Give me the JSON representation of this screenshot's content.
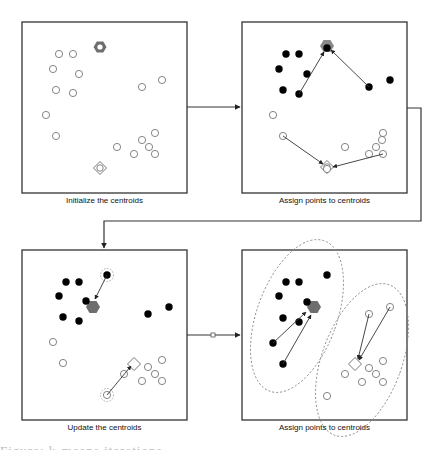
{
  "diagram": {
    "colors": {
      "border": "#333333",
      "cluster_a_point": "#000000",
      "cluster_b_point": "#ffffff",
      "open_point_stroke": "#777777",
      "centroid_a": "#6e6e6e",
      "centroid_b_stroke": "#777777",
      "arrow": "#333333",
      "ellipse": "#888888"
    },
    "panels": [
      {
        "id": "init",
        "caption": "Initialize the centroids",
        "box": [
          22,
          22,
          165,
          171
        ],
        "points_open": [
          [
            59,
            54
          ],
          [
            73,
            54
          ],
          [
            53,
            69
          ],
          [
            79,
            74
          ],
          [
            56,
            90
          ],
          [
            73,
            93
          ],
          [
            46,
            115
          ],
          [
            56,
            136
          ],
          [
            142,
            87
          ],
          [
            162,
            80
          ],
          [
            155,
            133
          ],
          [
            142,
            140
          ],
          [
            149,
            147
          ],
          [
            155,
            154
          ],
          [
            134,
            154
          ],
          [
            117,
            147
          ]
        ],
        "points_filled": [],
        "hexagon": {
          "x": 100,
          "y": 47,
          "style": "ring"
        },
        "diamond": {
          "x": 100,
          "y": 168,
          "style": "ring"
        },
        "arrows": [],
        "ellipses": []
      },
      {
        "id": "assign1",
        "caption": "Assign points to centroids",
        "box": [
          242,
          22,
          165,
          171
        ],
        "points_filled": [
          [
            286,
            54
          ],
          [
            299,
            54
          ],
          [
            279,
            69
          ],
          [
            307,
            74
          ],
          [
            283,
            90
          ],
          [
            299,
            94
          ],
          [
            369,
            87
          ],
          [
            390,
            80
          ],
          [
            327,
            48
          ]
        ],
        "points_open": [
          [
            273,
            115
          ],
          [
            283,
            136
          ],
          [
            345,
            147
          ],
          [
            369,
            154
          ],
          [
            382,
            140
          ],
          [
            376,
            147
          ],
          [
            383,
            133
          ],
          [
            383,
            154
          ],
          [
            327,
            169
          ]
        ],
        "hexagon": {
          "x": 327,
          "y": 46,
          "style": "behind"
        },
        "diamond": {
          "x": 327,
          "y": 167,
          "style": "ring"
        },
        "arrows": [
          [
            299,
            94,
            324,
            52
          ],
          [
            369,
            87,
            331,
            50
          ],
          [
            283,
            136,
            323,
            164
          ],
          [
            383,
            154,
            333,
            167
          ]
        ],
        "ellipses": []
      },
      {
        "id": "update",
        "caption": "Update the centroids",
        "box": [
          22,
          250,
          165,
          170
        ],
        "points_filled": [
          [
            66,
            282
          ],
          [
            79,
            282
          ],
          [
            59,
            296
          ],
          [
            86,
            301
          ],
          [
            63,
            317
          ],
          [
            79,
            321
          ],
          [
            107,
            275
          ],
          [
            148,
            314
          ],
          [
            169,
            307
          ]
        ],
        "points_open": [
          [
            53,
            342
          ],
          [
            63,
            363
          ],
          [
            124,
            374
          ],
          [
            107,
            395
          ],
          [
            148,
            367
          ],
          [
            155,
            374
          ],
          [
            162,
            360
          ],
          [
            142,
            381
          ],
          [
            162,
            381
          ]
        ],
        "dashed_rings": [
          [
            107,
            275
          ],
          [
            107,
            395
          ]
        ],
        "hexagon": {
          "x": 93,
          "y": 307,
          "style": "solid"
        },
        "diamond": {
          "x": 134,
          "y": 364,
          "style": "plain"
        },
        "arrows": [
          [
            107,
            275,
            95,
            299
          ],
          [
            107,
            395,
            131,
            366
          ]
        ],
        "ellipses": []
      },
      {
        "id": "assign2",
        "caption": "Assign points to centroids",
        "box": [
          242,
          250,
          165,
          170
        ],
        "points_filled": [
          [
            327,
            275
          ],
          [
            286,
            282
          ],
          [
            299,
            282
          ],
          [
            279,
            296
          ],
          [
            307,
            302
          ],
          [
            283,
            318
          ],
          [
            299,
            322
          ],
          [
            273,
            343
          ],
          [
            283,
            364
          ]
        ],
        "points_open": [
          [
            369,
            314
          ],
          [
            390,
            307
          ],
          [
            383,
            361
          ],
          [
            369,
            368
          ],
          [
            376,
            374
          ],
          [
            345,
            374
          ],
          [
            362,
            382
          ],
          [
            383,
            382
          ],
          [
            327,
            396
          ]
        ],
        "hexagon": {
          "x": 314,
          "y": 307,
          "style": "solid"
        },
        "diamond": {
          "x": 355,
          "y": 364,
          "style": "plain"
        },
        "arrows": [
          [
            273,
            343,
            306,
            312
          ],
          [
            283,
            364,
            311,
            315
          ],
          [
            369,
            314,
            358,
            359
          ],
          [
            390,
            307,
            359,
            360
          ]
        ],
        "ellipses": [
          {
            "cx": 297,
            "cy": 316,
            "rx": 40,
            "ry": 80,
            "rot": 20
          },
          {
            "cx": 362,
            "cy": 360,
            "rx": 40,
            "ry": 80,
            "rot": 20
          }
        ]
      }
    ],
    "connectors": [
      {
        "id": "init-to-assign1",
        "path": "M187,107 L240,107"
      },
      {
        "id": "assign1-to-update",
        "path": "M407,108 L421,108 L421,221 L104,221 L104,248"
      },
      {
        "id": "update-to-assign2",
        "path": "M187,335 L240,335",
        "marker_square": [
          213,
          335
        ]
      }
    ],
    "clipped_footer_text": "Figure: k-means iterations"
  }
}
